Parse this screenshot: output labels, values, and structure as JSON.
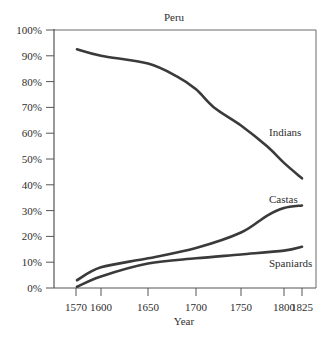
{
  "chart_data": {
    "type": "line",
    "title": "Peru",
    "xlabel": "Year",
    "ylabel": "",
    "x_ticks": [
      1570,
      1600,
      1650,
      1700,
      1750,
      1800,
      1825
    ],
    "y_ticks": [
      "0%",
      "10%",
      "20%",
      "30%",
      "40%",
      "50%",
      "60%",
      "70%",
      "80%",
      "90%",
      "100%"
    ],
    "ylim": [
      0,
      100
    ],
    "xlim": [
      1545,
      1830
    ],
    "grid": false,
    "legend": "inline labels",
    "series": [
      {
        "name": "Indians",
        "x": [
          1570,
          1600,
          1650,
          1680,
          1700,
          1720,
          1750,
          1780,
          1800,
          1825
        ],
        "values": [
          92.5,
          90,
          87,
          82,
          77,
          70,
          63,
          55,
          48.5,
          42.5
        ]
      },
      {
        "name": "Castas",
        "x": [
          1570,
          1600,
          1650,
          1700,
          1750,
          1780,
          1800,
          1825
        ],
        "values": [
          3,
          8,
          11.5,
          15.5,
          21.5,
          28,
          31,
          32
        ]
      },
      {
        "name": "Spaniards",
        "x": [
          1570,
          1600,
          1650,
          1700,
          1750,
          1800,
          1825
        ],
        "values": [
          0.5,
          4.5,
          9.5,
          11.5,
          13,
          14.5,
          16
        ]
      }
    ]
  },
  "labels": {
    "title": "Peru",
    "xlabel": "Year",
    "series_indians": "Indians",
    "series_castas": "Castas",
    "series_spaniards": "Spaniards"
  },
  "colors": {
    "line": "#3a3a3a",
    "axis": "#555555",
    "text": "#2e2e2e"
  }
}
